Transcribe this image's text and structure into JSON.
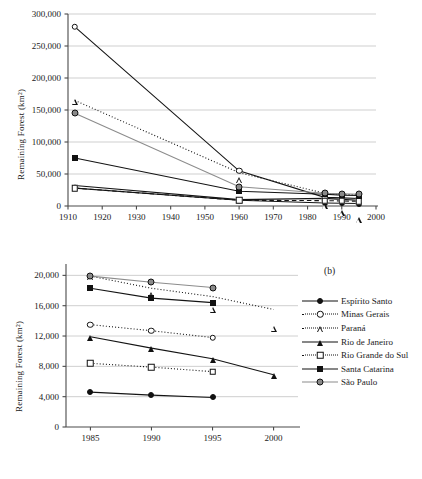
{
  "figure": {
    "panel_b_letter": "(b)"
  },
  "legend": {
    "position": "right",
    "items": [
      {
        "label": "Espírito Santo",
        "marker": "circle-filled",
        "line": "solid"
      },
      {
        "label": "Minas Gerais",
        "marker": "circle-open",
        "line": "dotted"
      },
      {
        "label": "Paraná",
        "marker": "tri-open",
        "line": "dotted"
      },
      {
        "label": "Rio de Janeiro",
        "marker": "tri-filled",
        "line": "solid"
      },
      {
        "label": "Rio Grande do Sul",
        "marker": "square-open",
        "line": "dotted"
      },
      {
        "label": "Santa Catarina",
        "marker": "square-filled",
        "line": "solid"
      },
      {
        "label": "São Paulo",
        "marker": "circle-gray",
        "line": "solid"
      }
    ]
  },
  "chart_data": [
    {
      "id": "panel-a",
      "type": "line",
      "title": "",
      "xlabel": "",
      "ylabel": "Remaining Forest (km2)",
      "ylabel_display": "Remaining Forest (km²)",
      "xlim": [
        1910,
        2000
      ],
      "ylim": [
        0,
        300000
      ],
      "xticks": [
        1910,
        1920,
        1930,
        1940,
        1950,
        1960,
        1970,
        1980,
        1990,
        2000
      ],
      "xticklabels": [
        "1910",
        "1920",
        "1930",
        "1940",
        "1950",
        "1960",
        "1970",
        "1980",
        "1990",
        "2000"
      ],
      "yticks": [
        0,
        50000,
        100000,
        150000,
        200000,
        250000,
        300000
      ],
      "yticklabels": [
        "0",
        "50,000",
        "100,000",
        "150,000",
        "200,000",
        "250,000",
        "300,000"
      ],
      "grid": "horizontal",
      "legend_position": "none",
      "series": [
        {
          "name": "Espírito Santo",
          "marker": "circle-filled",
          "line": "solid",
          "x": [
            1912,
            1960,
            1985,
            1990,
            1995
          ],
          "values": [
            28000,
            9000,
            4600,
            4200,
            3900
          ]
        },
        {
          "name": "Minas Gerais",
          "marker": "circle-open",
          "line": "solid",
          "x": [
            1912,
            1960,
            1985,
            1990,
            1995
          ],
          "values": [
            280000,
            55000,
            13500,
            12700,
            11800
          ]
        },
        {
          "name": "Paraná",
          "marker": "tri-open",
          "line": "dotted",
          "x": [
            1912,
            1960,
            1985,
            1990,
            1995
          ],
          "values": [
            165000,
            52000,
            19900,
            18300,
            17200
          ]
        },
        {
          "name": "Rio de Janeiro",
          "marker": "tri-filled",
          "line": "solid",
          "x": [
            1912,
            1960,
            1985,
            1990,
            1995
          ],
          "values": [
            32000,
            10000,
            11900,
            10400,
            9000
          ]
        },
        {
          "name": "Rio Grande do Sul",
          "marker": "square-open",
          "line": "dashed",
          "x": [
            1912,
            1960,
            1985,
            1990,
            1995
          ],
          "values": [
            28000,
            9000,
            8400,
            7900,
            7300
          ]
        },
        {
          "name": "Santa Catarina",
          "marker": "square-filled",
          "line": "solid",
          "x": [
            1912,
            1960,
            1985,
            1990,
            1995
          ],
          "values": [
            75000,
            23000,
            18300,
            17000,
            16400
          ]
        },
        {
          "name": "São Paulo",
          "marker": "circle-gray",
          "line": "solid",
          "x": [
            1912,
            1960,
            1985,
            1990,
            1995
          ],
          "values": [
            145000,
            30000,
            19900,
            19100,
            18400
          ]
        }
      ]
    },
    {
      "id": "panel-b",
      "type": "line",
      "title": "(b)",
      "xlabel": "",
      "ylabel": "Remaining Forest (km2)",
      "ylabel_display": "Remaining Forest (km²)",
      "xlim": [
        1983,
        2002
      ],
      "ylim": [
        0,
        21500
      ],
      "xticks": [
        1985,
        1990,
        1995,
        2000
      ],
      "xticklabels": [
        "1985",
        "1990",
        "1995",
        "2000"
      ],
      "yticks": [
        0,
        4000,
        8000,
        12000,
        16000,
        20000
      ],
      "yticklabels": [
        "0",
        "4,000",
        "8,000",
        "12,000",
        "16,000",
        "20,000"
      ],
      "grid": "horizontal",
      "legend_position": "right",
      "series": [
        {
          "name": "Espírito Santo",
          "marker": "circle-filled",
          "line": "solid",
          "x": [
            1985,
            1990,
            1995
          ],
          "values": [
            4600,
            4200,
            3900
          ]
        },
        {
          "name": "Minas Gerais",
          "marker": "circle-open",
          "line": "dotted",
          "x": [
            1985,
            1990,
            1995
          ],
          "values": [
            13500,
            12700,
            11800
          ]
        },
        {
          "name": "Paraná",
          "marker": "tri-open",
          "line": "dotted",
          "x": [
            1985,
            1990,
            1995,
            2000
          ],
          "values": [
            19900,
            18300,
            17200,
            15500
          ]
        },
        {
          "name": "Rio de Janeiro",
          "marker": "tri-filled",
          "line": "solid",
          "x": [
            1985,
            1990,
            1995,
            2000
          ],
          "values": [
            11900,
            10400,
            9000,
            6900
          ]
        },
        {
          "name": "Rio Grande do Sul",
          "marker": "square-open",
          "line": "dotted",
          "x": [
            1985,
            1990,
            1995
          ],
          "values": [
            8400,
            7900,
            7300
          ]
        },
        {
          "name": "Santa Catarina",
          "marker": "square-filled",
          "line": "solid",
          "x": [
            1985,
            1990,
            1995
          ],
          "values": [
            18300,
            17000,
            16400
          ]
        },
        {
          "name": "São Paulo",
          "marker": "circle-gray",
          "line": "solid",
          "x": [
            1985,
            1990,
            1995
          ],
          "values": [
            19900,
            19100,
            18400
          ]
        }
      ]
    }
  ]
}
